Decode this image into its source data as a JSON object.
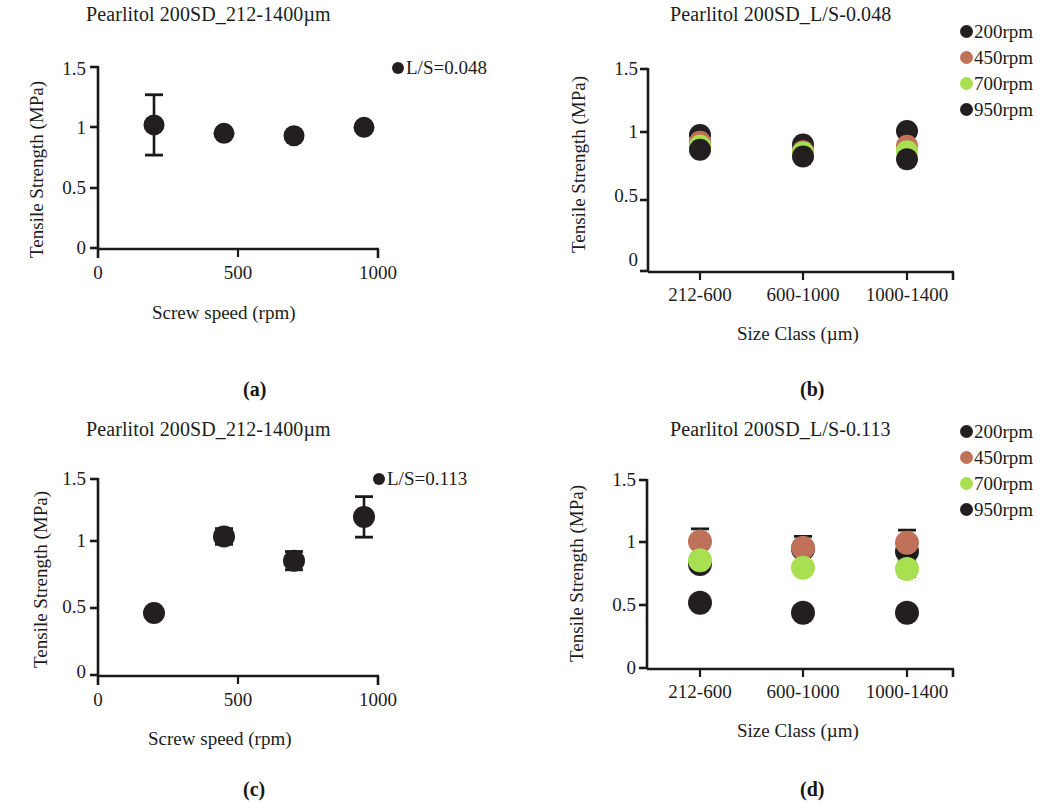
{
  "figure": {
    "background": "#ffffff",
    "axis_color": "#1a1a1a",
    "text_color": "#1c1c1c"
  },
  "series_colors": {
    "black": "#231f20",
    "salmon": "#c0715a",
    "green": "#a8e052"
  },
  "panels": {
    "a": {
      "caption": "(a)",
      "title": "Pearlitol 200SD_212-1400µm",
      "xlabel": "Screw speed (rpm)",
      "ylabel": "Tensile  Strength (MPa)",
      "legend_label": "L/S=0.048",
      "legend_color": "#231f20",
      "yticks": [
        "0",
        "0.5",
        "1",
        "1.5"
      ],
      "xticks": [
        "0",
        "500",
        "1000"
      ]
    },
    "b": {
      "caption": "(b)",
      "title": "Pearlitol 200SD_L/S-0.048",
      "xlabel": "Size Class (µm)",
      "ylabel": "Tensile Strength (MPa)",
      "yticks": [
        "0",
        "0.5",
        "1",
        "1.5"
      ],
      "xticks": [
        "212-600",
        "600-1000",
        "1000-1400"
      ],
      "legend": [
        {
          "label": "200rpm",
          "color": "#231f20"
        },
        {
          "label": "450rpm",
          "color": "#c0715a"
        },
        {
          "label": "700rpm",
          "color": "#a8e052"
        },
        {
          "label": "950rpm",
          "color": "#231f20"
        }
      ]
    },
    "c": {
      "caption": "(c)",
      "title": "Pearlitol 200SD_212-1400µm",
      "xlabel": "Screw speed (rpm)",
      "ylabel": "Tensile Strength (MPa)",
      "legend_label": "L/S=0.113",
      "legend_color": "#231f20",
      "yticks": [
        "0",
        "0.5",
        "1",
        "1.5"
      ],
      "xticks": [
        "0",
        "500",
        "1000"
      ]
    },
    "d": {
      "caption": "(d)",
      "title": "Pearlitol 200SD_L/S-0.113",
      "xlabel": "Size Class (µm)",
      "ylabel": "Tensile Strength (MPa)",
      "yticks": [
        "0",
        "0.5",
        "1",
        "1.5"
      ],
      "xticks": [
        "212-600",
        "600-1000",
        "1000-1400"
      ],
      "legend": [
        {
          "label": "200rpm",
          "color": "#231f20"
        },
        {
          "label": "450rpm",
          "color": "#c0715a"
        },
        {
          "label": "700rpm",
          "color": "#a8e052"
        },
        {
          "label": "950rpm",
          "color": "#231f20"
        }
      ]
    }
  },
  "chart_data": [
    {
      "panel": "a",
      "type": "scatter",
      "title": "Pearlitol 200SD_212-1400µm",
      "xlabel": "Screw speed (rpm)",
      "ylabel": "Tensile  Strength (MPa)",
      "xlim": [
        0,
        1080
      ],
      "ylim": [
        0,
        1.5
      ],
      "xticks": [
        0,
        500,
        1000
      ],
      "yticks": [
        0,
        0.5,
        1,
        1.5
      ],
      "grid": false,
      "legend_position": "top-right",
      "series": [
        {
          "name": "L/S=0.048",
          "color": "#231f20",
          "x": [
            200,
            450,
            700,
            950
          ],
          "values": [
            1.02,
            0.95,
            0.93,
            1.0
          ],
          "errors": [
            0.25,
            0.0,
            0.015,
            0.0
          ]
        }
      ]
    },
    {
      "panel": "b",
      "type": "scatter",
      "title": "Pearlitol 200SD_L/S-0.048",
      "xlabel": "Size Class (µm)",
      "ylabel": "Tensile Strength (MPa)",
      "categories": [
        "212-600",
        "600-1000",
        "1000-1400"
      ],
      "ylim": [
        0,
        1.5
      ],
      "yticks": [
        0,
        0.5,
        1,
        1.5
      ],
      "grid": false,
      "legend_position": "right",
      "series": [
        {
          "name": "200rpm",
          "color": "#231f20",
          "values": [
            1.01,
            0.94,
            1.04
          ],
          "errors": [
            0.04,
            0.04,
            0.0
          ]
        },
        {
          "name": "450rpm",
          "color": "#c0715a",
          "values": [
            0.96,
            0.89,
            0.93
          ],
          "errors": [
            0.0,
            0.0,
            0.0
          ]
        },
        {
          "name": "700rpm",
          "color": "#a8e052",
          "values": [
            0.93,
            0.88,
            0.89
          ],
          "errors": [
            0.03,
            0.0,
            0.0
          ]
        },
        {
          "name": "950rpm",
          "color": "#231f20",
          "values": [
            0.9,
            0.85,
            0.83
          ],
          "errors": [
            0.0,
            0.05,
            0.05
          ]
        }
      ]
    },
    {
      "panel": "c",
      "type": "scatter",
      "title": "Pearlitol 200SD_212-1400µm",
      "xlabel": "Screw speed (rpm)",
      "ylabel": "Tensile Strength (MPa)",
      "xlim": [
        0,
        1080
      ],
      "ylim": [
        0,
        1.5
      ],
      "xticks": [
        0,
        500,
        1000
      ],
      "yticks": [
        0,
        0.5,
        1,
        1.5
      ],
      "grid": false,
      "legend_position": "top-right",
      "series": [
        {
          "name": "L/S=0.113",
          "color": "#231f20",
          "x": [
            200,
            450,
            700,
            950
          ],
          "values": [
            0.475,
            1.06,
            0.875,
            1.21
          ],
          "errors": [
            0.0,
            0.06,
            0.07,
            0.155
          ]
        }
      ]
    },
    {
      "panel": "d",
      "type": "scatter",
      "title": "Pearlitol 200SD_L/S-0.113",
      "xlabel": "Size Class (µm)",
      "ylabel": "Tensile Strength (MPa)",
      "categories": [
        "212-600",
        "600-1000",
        "1000-1400"
      ],
      "ylim": [
        0,
        1.5
      ],
      "yticks": [
        0,
        0.5,
        1,
        1.5
      ],
      "grid": false,
      "legend_position": "right",
      "series": [
        {
          "name": "200rpm",
          "color": "#231f20",
          "values": [
            0.83,
            0.95,
            0.93
          ],
          "errors": [
            0.05,
            0.1,
            0.1
          ]
        },
        {
          "name": "450rpm",
          "color": "#c0715a",
          "values": [
            1.01,
            0.96,
            1.0
          ],
          "errors": [
            0.1,
            0.0,
            0.1
          ]
        },
        {
          "name": "700rpm",
          "color": "#a8e052",
          "values": [
            0.86,
            0.8,
            0.79
          ],
          "errors": [
            0.0,
            0.05,
            0.06
          ]
        },
        {
          "name": "950rpm",
          "color": "#231f20",
          "values": [
            0.52,
            0.44,
            0.44
          ],
          "errors": [
            0.0,
            0.0,
            0.0
          ]
        }
      ]
    }
  ]
}
